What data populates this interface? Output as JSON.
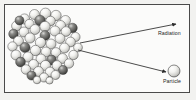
{
  "diagram": {
    "frame": {
      "border_color": "#4a4a4a",
      "background_color": "#fbfbfa",
      "outer_background_color": "#f2f2f0"
    },
    "nucleus": {
      "name": "nucleus-cluster",
      "center_x": 45.5,
      "center_y": 47.5,
      "radius": 35,
      "sphere_light_color": "#f6f6f4",
      "sphere_dark_color": "#5a5a5a",
      "sphere_mid_color": "#b9b9b7",
      "outline_color": "#3a3a3a",
      "spheres": [
        {
          "x": 45.5,
          "y": 13.5,
          "r": 5.4,
          "shade": "light"
        },
        {
          "x": 34.5,
          "y": 14.5,
          "r": 5.0,
          "shade": "light"
        },
        {
          "x": 56.0,
          "y": 15.5,
          "r": 5.2,
          "shade": "light"
        },
        {
          "x": 24.5,
          "y": 19.0,
          "r": 5.1,
          "shade": "light"
        },
        {
          "x": 65.5,
          "y": 20.5,
          "r": 5.0,
          "shade": "light"
        },
        {
          "x": 40.0,
          "y": 20.5,
          "r": 5.3,
          "shade": "dark"
        },
        {
          "x": 50.5,
          "y": 21.0,
          "r": 4.8,
          "shade": "light"
        },
        {
          "x": 16.5,
          "y": 26.0,
          "r": 4.9,
          "shade": "light"
        },
        {
          "x": 72.5,
          "y": 28.0,
          "r": 4.8,
          "shade": "dark"
        },
        {
          "x": 29.5,
          "y": 24.0,
          "r": 4.7,
          "shade": "light"
        },
        {
          "x": 60.5,
          "y": 25.5,
          "r": 5.0,
          "shade": "light"
        },
        {
          "x": 19.5,
          "y": 20.5,
          "r": 4.5,
          "shade": "dark"
        },
        {
          "x": 45.0,
          "y": 26.5,
          "r": 5.2,
          "shade": "light"
        },
        {
          "x": 35.0,
          "y": 29.5,
          "r": 5.0,
          "shade": "light"
        },
        {
          "x": 55.0,
          "y": 31.0,
          "r": 5.1,
          "shade": "light"
        },
        {
          "x": 24.0,
          "y": 32.0,
          "r": 5.0,
          "shade": "light"
        },
        {
          "x": 66.0,
          "y": 31.5,
          "r": 4.9,
          "shade": "light"
        },
        {
          "x": 13.5,
          "y": 34.0,
          "r": 4.8,
          "shade": "dark"
        },
        {
          "x": 75.5,
          "y": 37.0,
          "r": 4.6,
          "shade": "light"
        },
        {
          "x": 45.0,
          "y": 35.5,
          "r": 5.0,
          "shade": "dark"
        },
        {
          "x": 30.0,
          "y": 38.0,
          "r": 5.1,
          "shade": "light"
        },
        {
          "x": 60.0,
          "y": 38.5,
          "r": 5.0,
          "shade": "light"
        },
        {
          "x": 18.5,
          "y": 41.0,
          "r": 5.0,
          "shade": "light"
        },
        {
          "x": 70.5,
          "y": 42.0,
          "r": 4.9,
          "shade": "light"
        },
        {
          "x": 40.5,
          "y": 42.5,
          "r": 5.2,
          "shade": "light"
        },
        {
          "x": 51.0,
          "y": 44.0,
          "r": 5.0,
          "shade": "light"
        },
        {
          "x": 12.5,
          "y": 46.5,
          "r": 4.7,
          "shade": "light"
        },
        {
          "x": 78.0,
          "y": 47.5,
          "r": 4.4,
          "shade": "light"
        },
        {
          "x": 25.0,
          "y": 47.5,
          "r": 5.1,
          "shade": "dark"
        },
        {
          "x": 64.5,
          "y": 48.0,
          "r": 5.0,
          "shade": "light"
        },
        {
          "x": 35.5,
          "y": 50.5,
          "r": 5.2,
          "shade": "light"
        },
        {
          "x": 46.0,
          "y": 52.0,
          "r": 5.0,
          "shade": "light"
        },
        {
          "x": 56.0,
          "y": 52.5,
          "r": 4.9,
          "shade": "light"
        },
        {
          "x": 16.0,
          "y": 55.0,
          "r": 5.0,
          "shade": "light"
        },
        {
          "x": 73.5,
          "y": 55.0,
          "r": 4.7,
          "shade": "light"
        },
        {
          "x": 28.0,
          "y": 57.0,
          "r": 5.1,
          "shade": "light"
        },
        {
          "x": 41.0,
          "y": 59.0,
          "r": 5.0,
          "shade": "light"
        },
        {
          "x": 51.5,
          "y": 60.0,
          "r": 4.9,
          "shade": "dark"
        },
        {
          "x": 62.5,
          "y": 58.5,
          "r": 5.0,
          "shade": "light"
        },
        {
          "x": 20.5,
          "y": 62.0,
          "r": 4.9,
          "shade": "dark"
        },
        {
          "x": 69.0,
          "y": 63.5,
          "r": 4.7,
          "shade": "light"
        },
        {
          "x": 33.5,
          "y": 64.5,
          "r": 5.0,
          "shade": "light"
        },
        {
          "x": 45.5,
          "y": 65.5,
          "r": 5.1,
          "shade": "light"
        },
        {
          "x": 57.0,
          "y": 65.5,
          "r": 4.9,
          "shade": "light"
        },
        {
          "x": 26.0,
          "y": 69.5,
          "r": 4.8,
          "shade": "light"
        },
        {
          "x": 63.0,
          "y": 70.0,
          "r": 4.6,
          "shade": "dark"
        },
        {
          "x": 38.5,
          "y": 71.5,
          "r": 5.0,
          "shade": "light"
        },
        {
          "x": 50.0,
          "y": 72.0,
          "r": 4.9,
          "shade": "light"
        },
        {
          "x": 31.5,
          "y": 75.5,
          "r": 4.6,
          "shade": "dark"
        },
        {
          "x": 44.0,
          "y": 77.5,
          "r": 4.6,
          "shade": "light"
        },
        {
          "x": 55.5,
          "y": 75.0,
          "r": 4.5,
          "shade": "light"
        },
        {
          "x": 37.0,
          "y": 80.0,
          "r": 3.8,
          "shade": "light"
        },
        {
          "x": 49.5,
          "y": 80.5,
          "r": 3.6,
          "shade": "light"
        }
      ]
    },
    "arrows": [
      {
        "name": "radiation-arrow",
        "x1": 80,
        "y1": 43,
        "x2": 176,
        "y2": 24,
        "color": "#2a2a2a"
      },
      {
        "name": "particle-arrow",
        "x1": 78,
        "y1": 50,
        "x2": 166,
        "y2": 72,
        "color": "#2a2a2a"
      }
    ],
    "emitted_particle": {
      "name": "emitted-particle-sphere",
      "cx": 174,
      "cy": 71,
      "r": 6,
      "fill_color": "#f6f6f4",
      "outline_color": "#3a3a3a"
    },
    "labels": {
      "radiation": "Radiation",
      "particle": "Particle",
      "text_color": "#1b1b1b"
    }
  }
}
